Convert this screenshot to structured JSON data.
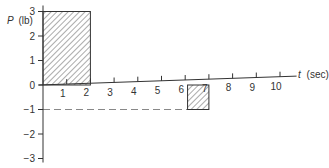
{
  "chart_data": {
    "type": "bar",
    "title": "",
    "xlabel": "t (sec)",
    "ylabel": "P (lb)",
    "xlabel_parts": {
      "var": "t",
      "unit": "(sec)"
    },
    "ylabel_parts": {
      "var": "P",
      "unit": "(lb)"
    },
    "xlim": [
      0,
      10
    ],
    "ylim": [
      -3,
      3
    ],
    "x_ticks": [
      1,
      2,
      3,
      4,
      5,
      6,
      7,
      8,
      9,
      10
    ],
    "y_ticks": [
      3,
      2,
      1,
      0,
      -1,
      -2,
      -3
    ],
    "grid": false,
    "legend": null,
    "series": [
      {
        "name": "pulse-1",
        "t_start": 0,
        "t_end": 2,
        "P": 3,
        "style": "hatched"
      },
      {
        "name": "pulse-2",
        "t_start": 6.1,
        "t_end": 7,
        "P": -1,
        "style": "hatched"
      }
    ],
    "reference_lines": [
      {
        "name": "P=-1 dashed",
        "P": -1,
        "t_start": 0,
        "t_end": 6.1,
        "style": "dashed"
      }
    ]
  },
  "colors": {
    "ink": "#333333",
    "dashed": "#888888",
    "background": "#ffffff"
  }
}
